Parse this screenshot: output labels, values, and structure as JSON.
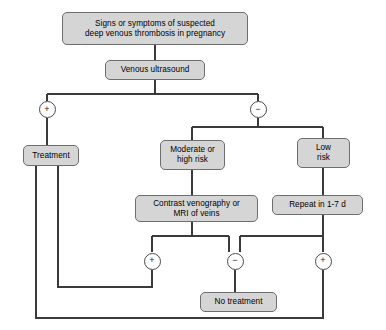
{
  "diagram": {
    "colors": {
      "node_fill": "#d5d5d5",
      "node_border": "#6e6e6e",
      "edge": "#3a3a3a",
      "background": "#ffffff"
    },
    "nodes": [
      {
        "id": "signs",
        "label_line1": "Signs or symptoms of suspected",
        "label_line2": "deep venous thrombosis in pregnancy"
      },
      {
        "id": "ultrasound",
        "label_line1": "Venous ultrasound"
      },
      {
        "id": "treatment",
        "label_line1": "Treatment"
      },
      {
        "id": "moderate_high",
        "label_line1": "Moderate or",
        "label_line2": "high risk"
      },
      {
        "id": "low_risk",
        "label_line1": "Low",
        "label_line2": "risk"
      },
      {
        "id": "venography",
        "label_line1": "Contrast venography or",
        "label_line2": "MRI of veins"
      },
      {
        "id": "repeat",
        "label_line1": "Repeat in 1-7 d"
      },
      {
        "id": "no_treatment",
        "label_line1": "No treatment"
      }
    ],
    "decisions": [
      {
        "id": "us_positive",
        "symbol": "+"
      },
      {
        "id": "us_negative",
        "symbol": "−"
      },
      {
        "id": "venography_positive",
        "symbol": "+"
      },
      {
        "id": "venography_negative",
        "symbol": "−"
      },
      {
        "id": "repeat_positive",
        "symbol": "+"
      }
    ]
  }
}
